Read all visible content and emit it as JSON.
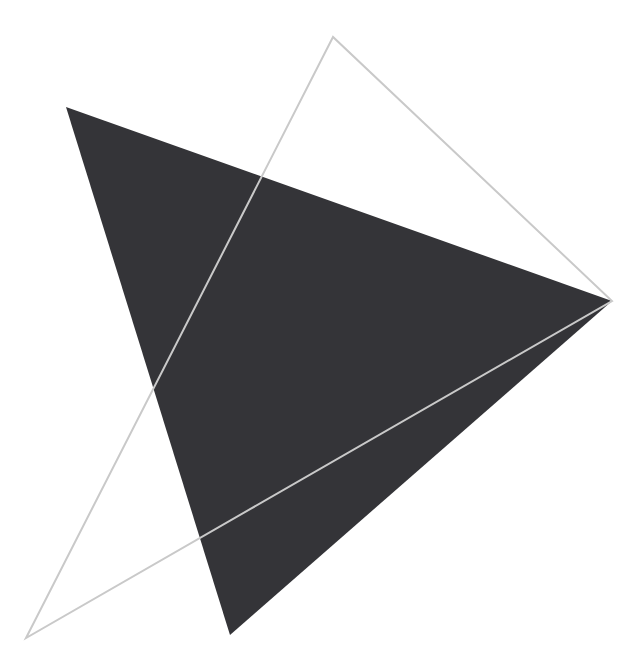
{
  "canvas": {
    "width": 643,
    "height": 669,
    "background_color": "#ffffff",
    "title": "abstract-geometric-composition"
  },
  "palette": {
    "fill_dark": "#343438",
    "outline_gray": "#c9c9c9",
    "background": "#ffffff"
  },
  "chart_data": {
    "type": "scatter",
    "title": "",
    "xlabel": "",
    "ylabel": "",
    "xlim": [
      0,
      643
    ],
    "ylim": [
      0,
      669
    ],
    "grid": false,
    "legend": null,
    "shapes": [
      {
        "name": "filled-triangle",
        "kind": "polygon",
        "fill": "#343438",
        "stroke": "none",
        "fill_rule": "evenodd",
        "points": [
          [
            66,
            107
          ],
          [
            612,
            301
          ],
          [
            230,
            635
          ]
        ]
      },
      {
        "name": "outline-triangle",
        "kind": "polygon",
        "fill": "none",
        "stroke": "#c9c9c9",
        "stroke_width": 2,
        "points": [
          [
            333,
            37
          ],
          [
            26,
            638
          ],
          [
            612,
            301
          ]
        ]
      }
    ],
    "visible_dark_regions": [
      {
        "name": "upper-left-wedge",
        "points": [
          [
            66,
            107
          ],
          [
            145,
            353
          ],
          [
            46,
            363
          ]
        ]
      },
      {
        "name": "right-wedge",
        "points": [
          [
            525,
            224
          ],
          [
            612,
            301
          ],
          [
            413,
            321
          ]
        ]
      },
      {
        "name": "central-band",
        "points": [
          [
            280,
            335
          ],
          [
            413,
            321
          ],
          [
            190,
            503
          ]
        ]
      },
      {
        "name": "lower-spike",
        "points": [
          [
            190,
            503
          ],
          [
            268,
            452
          ],
          [
            230,
            635
          ]
        ]
      }
    ],
    "intersection_points": [
      [
        413,
        321
      ],
      [
        280,
        335
      ],
      [
        190,
        503
      ],
      [
        46,
        363
      ],
      [
        145,
        353
      ],
      [
        525,
        224
      ]
    ],
    "vertices_labeled": [
      {
        "label": "filled-apex-top-left",
        "x": 66,
        "y": 107
      },
      {
        "label": "filled-apex-right",
        "x": 612,
        "y": 301
      },
      {
        "label": "filled-apex-bottom",
        "x": 230,
        "y": 635
      },
      {
        "label": "outline-apex-top",
        "x": 333,
        "y": 37
      },
      {
        "label": "outline-apex-bottom-left",
        "x": 26,
        "y": 638
      },
      {
        "label": "outline-apex-right",
        "x": 612,
        "y": 301
      }
    ]
  }
}
